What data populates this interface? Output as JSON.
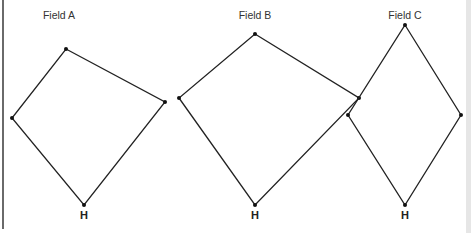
{
  "diagram": {
    "fields": [
      {
        "label": "Field A",
        "label_pos": [
          59,
          19
        ],
        "vertices": {
          "top": [
            66,
            49
          ],
          "right": [
            165,
            102
          ],
          "home": [
            84,
            205
          ],
          "left": [
            12,
            118
          ]
        },
        "home_label": "H"
      },
      {
        "label": "Field B",
        "label_pos": [
          255,
          19
        ],
        "vertices": {
          "top": [
            255,
            34
          ],
          "right": [
            359,
            98
          ],
          "home": [
            255,
            205
          ],
          "left": [
            179,
            98
          ]
        },
        "home_label": "H"
      },
      {
        "label": "Field C",
        "label_pos": [
          405,
          19
        ],
        "vertices": {
          "top": [
            405,
            25
          ],
          "right": [
            461,
            115
          ],
          "home": [
            405,
            205
          ],
          "left": [
            348,
            115
          ]
        },
        "home_label": "H"
      }
    ],
    "colors": {
      "line": "#222222",
      "label": "#333333"
    }
  }
}
